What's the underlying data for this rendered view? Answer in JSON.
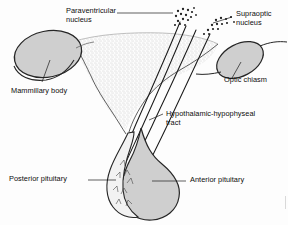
{
  "figure": {
    "type": "anatomical-diagram",
    "background_color": "#fdfdfd",
    "ink_color": "#111111",
    "fill_gray": "#cfcfcf",
    "stipple_color": "#9a9a9a"
  },
  "labels": {
    "paraventricular_nucleus": "Paraventricular\nnucleus",
    "supraoptic_nucleus": "Supraoptic\nnucleus",
    "optic_chiasm": "Optic chiasm",
    "mammillary_body": "Mammillary body",
    "hypothalamic_hypophyseal_tract": "Hypothalamic-hypophyseal\ntract",
    "posterior_pituitary": "Posterior pituitary",
    "anterior_pituitary": "Anterior pituitary"
  },
  "structures": [
    {
      "name": "mammillary-body",
      "shape": "ellipse",
      "fill": "#cfcfcf"
    },
    {
      "name": "optic-chiasm",
      "shape": "ellipse",
      "fill": "#cfcfcf"
    },
    {
      "name": "hypothalamus",
      "shape": "stippled-region",
      "fill": "#ffffff"
    },
    {
      "name": "anterior-pituitary",
      "shape": "teardrop",
      "fill": "#cfcfcf"
    },
    {
      "name": "posterior-pituitary",
      "shape": "lobe",
      "fill": "#f0f0f0"
    },
    {
      "name": "paraventricular-nucleus",
      "shape": "dot-cluster",
      "fill": "#2a2a2a"
    },
    {
      "name": "supraoptic-nucleus",
      "shape": "dot-cluster",
      "fill": "#2a2a2a"
    },
    {
      "name": "hypophyseal-tract",
      "shape": "fiber-bundle",
      "stroke": "#1a1a1a"
    }
  ]
}
